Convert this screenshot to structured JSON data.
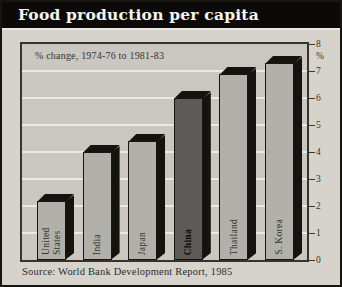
{
  "title_bar": {
    "title": "Food production per capita"
  },
  "chart": {
    "annotation": "% change, 1974-76 to 1981-83",
    "axis_unit": "%",
    "source": "Source: World Bank Development Report, 1985"
  },
  "chart_data": {
    "type": "bar",
    "title": "Food production per capita",
    "annotation": "% change, 1974-76 to 1981-83",
    "categories": [
      "United States",
      "India",
      "Japan",
      "China",
      "Thailand",
      "S. Korea"
    ],
    "values": [
      2.2,
      4.0,
      4.4,
      6.0,
      6.9,
      7.3
    ],
    "ylabel": "%",
    "ylim": [
      0,
      8
    ],
    "yticks": [
      0,
      1,
      2,
      3,
      4,
      5,
      6,
      7,
      8
    ],
    "grid": true,
    "legend_position": "none",
    "highlight_category": "China",
    "source": "Source: World Bank Development Report, 1985",
    "colors": {
      "banner_bg": "#0b0a08",
      "banner_text": "#f6f5f1",
      "page_bg": "#d6d3cd",
      "plot_bg": "#cac7c1",
      "gridline": "#ebe9e4",
      "bar_face": "#b2b0aa",
      "highlight_face": "#5d5b57",
      "bar_shadow": "#151310"
    }
  }
}
